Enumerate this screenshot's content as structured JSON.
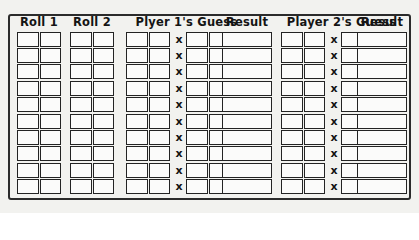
{
  "sheet": {
    "title": "Dice Roll Guess Scoring Sheet",
    "rows": 10,
    "background_color": "#f2f2ef",
    "ink_color": "#232323"
  },
  "columns": [
    {
      "id": "roll-1",
      "header": "Roll 1",
      "kind": "pair",
      "boxes": 2,
      "has_x": false,
      "has_arrow": false
    },
    {
      "id": "roll-2",
      "header": "Roll 2",
      "kind": "pair",
      "boxes": 2,
      "has_x": false,
      "has_arrow": false
    },
    {
      "id": "player-1-guess",
      "header": "Plyer 1's Guess",
      "kind": "guess",
      "boxes": 4,
      "has_x": true,
      "has_arrow": true,
      "x_symbol": "x"
    },
    {
      "id": "result-1",
      "header": "Result",
      "kind": "result",
      "boxes": 1,
      "has_x": false,
      "has_arrow": false
    },
    {
      "id": "player-2-guess",
      "header": "Player 2's Guess",
      "kind": "guess",
      "boxes": 4,
      "has_x": true,
      "has_arrow": true,
      "x_symbol": "x"
    },
    {
      "id": "result-2",
      "header": "Result",
      "kind": "result",
      "boxes": 1,
      "has_x": false,
      "has_arrow": false
    }
  ],
  "icons": {
    "arrow": "arrow-right-solid-icon"
  }
}
